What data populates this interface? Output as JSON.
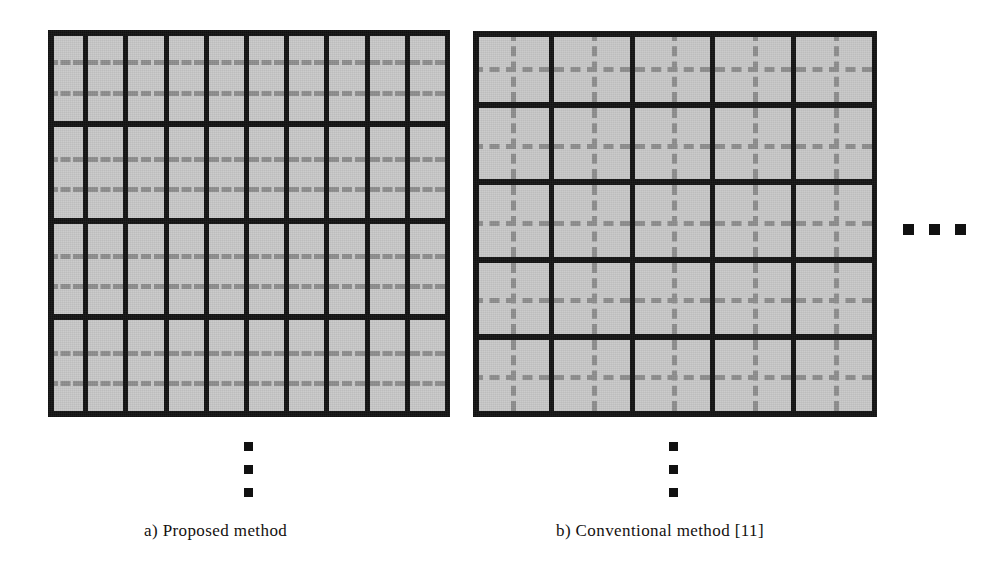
{
  "figure": {
    "background_color": "#ffffff",
    "block_color": "#c9c9c9",
    "line_color": "#141414",
    "dash_color": "#8e8e8e"
  },
  "panels": [
    {
      "id": "proposed",
      "caption": "a) Proposed method",
      "geometry": {
        "x": 48,
        "y": 30,
        "width": 402,
        "height": 387
      },
      "grid": {
        "columns": 10,
        "rows": 4,
        "cell_kind": "narrow-vertical-strip"
      },
      "dashes": {
        "horizontal_per_cell": 2,
        "vertical_per_cell": 0,
        "dashes_visible_per_line": 3
      },
      "ellipsis": {
        "orientation": "vertical",
        "count": 3,
        "x": 244,
        "y": 442
      }
    },
    {
      "id": "conventional",
      "caption": "b) Conventional method [11]",
      "geometry": {
        "x": 473,
        "y": 31,
        "width": 404,
        "height": 386
      },
      "grid": {
        "columns": 5,
        "rows": 5,
        "cell_kind": "square-block"
      },
      "dashes": {
        "horizontal_per_cell": 1,
        "vertical_per_cell": 1,
        "dashes_visible_per_line": 7
      },
      "ellipsis": {
        "orientation": "vertical",
        "count": 3,
        "x": 669,
        "y": 442
      }
    }
  ],
  "side_ellipsis": {
    "orientation": "horizontal",
    "count": 3,
    "x": 903,
    "y": 224
  }
}
